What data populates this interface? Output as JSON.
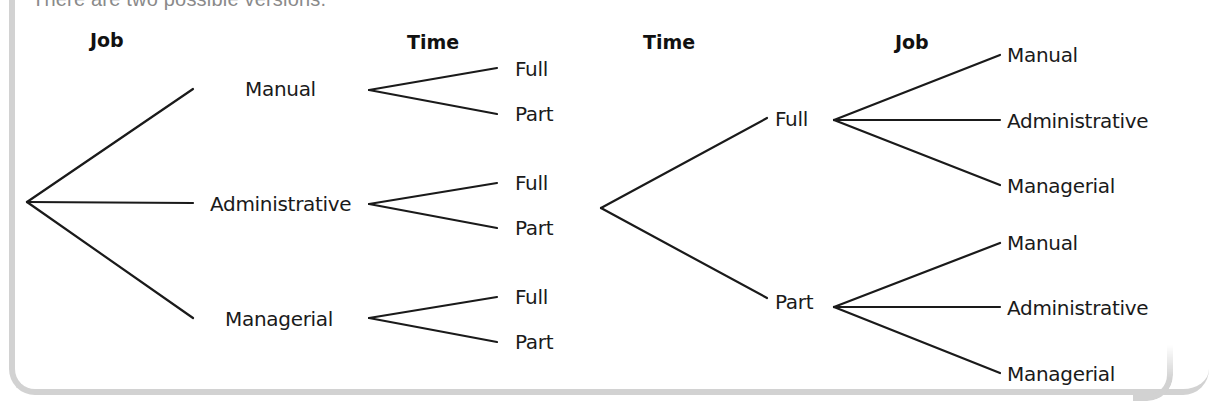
{
  "intro_text": "There are two possible versions.",
  "colors": {
    "line": "#1a1a1a",
    "border": "#d2d2d2",
    "intro_text": "#8a8a8a"
  },
  "tree_left": {
    "headers": {
      "level1": "Job",
      "level2": "Time"
    },
    "root": "",
    "level1": [
      "Manual",
      "Administrative",
      "Managerial"
    ],
    "level2": [
      [
        "Full",
        "Part"
      ],
      [
        "Full",
        "Part"
      ],
      [
        "Full",
        "Part"
      ]
    ]
  },
  "tree_right": {
    "headers": {
      "level1": "Time",
      "level2": "Job"
    },
    "root": "",
    "level1": [
      "Full",
      "Part"
    ],
    "level2": [
      [
        "Manual",
        "Administrative",
        "Managerial"
      ],
      [
        "Manual",
        "Administrative",
        "Managerial"
      ]
    ]
  }
}
